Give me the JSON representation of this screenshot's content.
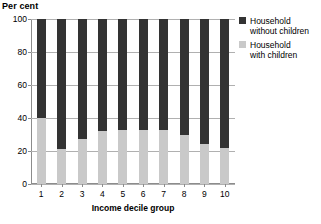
{
  "chart_data": {
    "type": "bar",
    "stacked": true,
    "percent": true,
    "title": "",
    "subtitle": "",
    "xlabel": "Income decile group",
    "ylabel": "Per cent",
    "unit_caption": "Per cent",
    "categories": [
      "1",
      "2",
      "3",
      "4",
      "5",
      "6",
      "7",
      "8",
      "9",
      "10"
    ],
    "ylim": [
      0,
      100
    ],
    "yticks": [
      0,
      20,
      40,
      60,
      80,
      100
    ],
    "ytick_labels": [
      "0",
      "20",
      "40",
      "60",
      "80",
      "100"
    ],
    "grid": true,
    "legend_position": "right",
    "series": [
      {
        "name": "Household with children",
        "color": "#c9c9c9",
        "values": [
          40,
          21,
          27,
          32,
          33,
          33,
          33,
          30,
          24,
          22
        ]
      },
      {
        "name": "Household without children",
        "color": "#333333",
        "values": [
          60,
          79,
          73,
          68,
          67,
          67,
          67,
          70,
          76,
          78
        ]
      }
    ]
  },
  "legend": {
    "entries": [
      {
        "label_line1": "Household",
        "label_line2": "without children",
        "swatch": "dark"
      },
      {
        "label_line1": "Household",
        "label_line2": "with children",
        "swatch": "light"
      }
    ]
  },
  "colors": {
    "without_children": "#333333",
    "with_children": "#c9c9c9",
    "gridline": "#b0b0b0",
    "axis": "#8c8c8c",
    "background": "#ffffff",
    "text": "#000000"
  }
}
